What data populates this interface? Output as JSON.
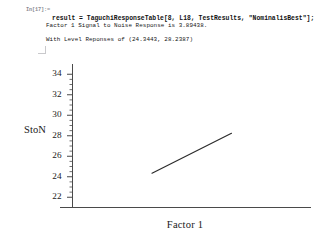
{
  "notebook": {
    "prompt_label": "In[17]:=",
    "input_code": "result = TaguchiResponseTable[8, L18, TestResults, \"NominalisBest\"];",
    "output_lines": [
      "Factor 1 Signal to Noise Response is 3.89438.",
      "With Level Reponses of (24.3443, 28.2387)"
    ]
  },
  "chart_data": {
    "type": "line",
    "title": "",
    "xlabel": "Factor 1",
    "ylabel": "StoN",
    "x": [
      1,
      2
    ],
    "values": [
      24.3443,
      28.2387
    ],
    "series": [
      {
        "name": "Factor 1 level response",
        "values": [
          24.3443,
          28.2387
        ]
      }
    ],
    "categories": [
      "1",
      "2"
    ],
    "ytick_labels": [
      "34",
      "32",
      "30",
      "28",
      "26",
      "24",
      "22"
    ],
    "ytick_values": [
      34,
      32,
      30,
      28,
      26,
      24,
      22
    ],
    "xtick_labels": [],
    "ylim": [
      21.0,
      35.0
    ],
    "xlim": [
      0.0,
      3.0
    ],
    "grid": false,
    "legend": "none",
    "line_color": "#2b2b2b",
    "axis_color": "#4a4a4a"
  }
}
